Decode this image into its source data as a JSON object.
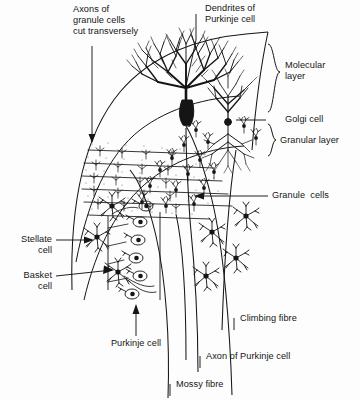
{
  "figure": {
    "domain": "Diagram",
    "background_color": "#fdfdfd",
    "ink_color": "#151515"
  },
  "labels": {
    "axons_granule": "Axons of\ngranule cells\ncut transversely",
    "dendrites_purkinje": "Dendrites of\nPurkinje cell",
    "molecular_layer": "Molecular\nlayer",
    "golgi_cell": "Golgi cell",
    "granular_layer": "Granular layer",
    "granule_cells": "Granule  cells",
    "stellate_cell": "Stellate\ncell",
    "basket_cell": "Basket\ncell",
    "purkinje_cell": "Purkinje cell",
    "climbing_fibre": "Climbing fibre",
    "axon_of_purkinje_cell": "Axon of Purkinje cell",
    "mossy_fibre": "Mossy fibre"
  },
  "structures": {
    "folium_outline": "curved arc of cerebellar folium",
    "molecular_layer_band": "outer pale band containing parallel fibres",
    "granular_layer_band": "inner band densely packed with granule cells",
    "purkinje_layer": "single row of teardrop Purkinje cell bodies",
    "parallel_fibres": "horizontal fibres running through molecular layer",
    "purkinje_dendritic_tree": "dense dark fan-shaped arborisation",
    "golgi_cell_body": "cell with dendrites above and axon plexus below",
    "stellate_cell_body": "small star-shaped neuron, outer molecular layer",
    "basket_cell_body": "star-shaped neuron with basket axon around Purkinje somata",
    "climbing_fibre_path": "fibre ascending to Purkinje dendrites",
    "mossy_fibre_path": "fibre ending in granular layer",
    "purkinje_axon_path": "axon descending into white matter"
  },
  "counts": {
    "purkinje_somata_in_row": 6,
    "parallel_fibre_lines": 6
  }
}
